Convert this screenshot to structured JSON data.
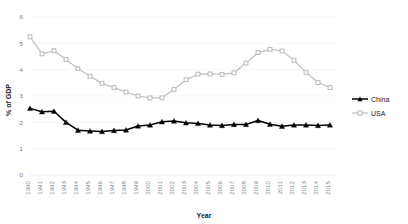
{
  "chart_data": {
    "type": "line",
    "title": "",
    "xlabel": "Year",
    "ylabel": "% of GDP",
    "ylim": [
      0,
      6
    ],
    "yticks": [
      "0",
      "1",
      "2",
      "3",
      "4",
      "5",
      "6"
    ],
    "grid": true,
    "legend_position": "right",
    "x": [
      "1990",
      "1991",
      "1992",
      "1993",
      "1994",
      "1995",
      "1996",
      "1997",
      "1998",
      "1999",
      "2000",
      "2001",
      "2002",
      "2003",
      "2004",
      "2005",
      "2006",
      "2007",
      "2008",
      "2009",
      "2010",
      "2011",
      "2012",
      "2013",
      "2014",
      "2015"
    ],
    "categories": [
      "1990",
      "1991",
      "1992",
      "1993",
      "1994",
      "1995",
      "1996",
      "1997",
      "1998",
      "1999",
      "2000",
      "2001",
      "2002",
      "2003",
      "2004",
      "2005",
      "2006",
      "2007",
      "2008",
      "2009",
      "2010",
      "2011",
      "2012",
      "2013",
      "2014",
      "2015"
    ],
    "series": [
      {
        "name": "China",
        "color": "#000000",
        "marker": "triangle",
        "values": [
          2.53,
          2.4,
          2.42,
          2.0,
          1.7,
          1.67,
          1.65,
          1.69,
          1.71,
          1.86,
          1.9,
          2.02,
          2.05,
          1.98,
          1.96,
          1.9,
          1.88,
          1.92,
          1.92,
          2.07,
          1.93,
          1.85,
          1.9,
          1.9,
          1.88,
          1.9
        ]
      },
      {
        "name": "USA",
        "color": "#bfbfbf",
        "marker": "square",
        "values": [
          5.25,
          4.6,
          4.72,
          4.39,
          4.04,
          3.75,
          3.48,
          3.32,
          3.15,
          3.0,
          2.93,
          2.93,
          3.25,
          3.62,
          3.83,
          3.84,
          3.82,
          3.88,
          4.25,
          4.65,
          4.77,
          4.71,
          4.36,
          3.89,
          3.51,
          3.32
        ]
      }
    ],
    "legend": [
      "China",
      "USA"
    ]
  },
  "legend": {
    "items": [
      {
        "label": "China",
        "color": "#000000"
      },
      {
        "label": "USA",
        "color": "#bfbfbf"
      }
    ]
  },
  "axes": {
    "x_title": "Year",
    "y_title": "% of GDP"
  }
}
